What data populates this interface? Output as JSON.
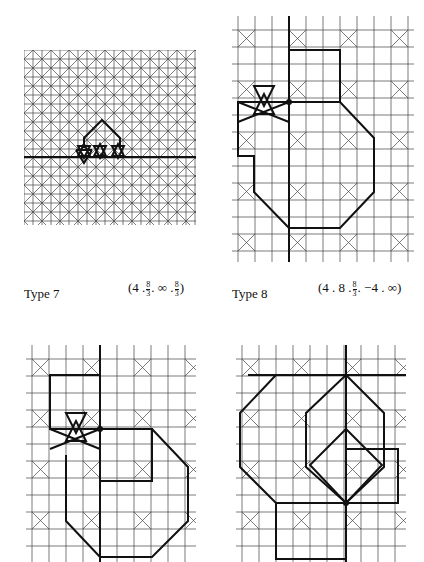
{
  "figures": [
    {
      "id": "type7",
      "label": "Type 7",
      "notation": {
        "parts": [
          "4",
          "8/3",
          "∞",
          "8/3"
        ]
      }
    },
    {
      "id": "type8",
      "label": "Type 8",
      "notation": {
        "parts": [
          "4",
          "8",
          "8/3",
          "−4",
          "∞"
        ]
      }
    },
    {
      "id": "type9_unlabeled",
      "label": ""
    },
    {
      "id": "type10_unlabeled",
      "label": ""
    }
  ],
  "captions": {
    "type7_label": "Type 7",
    "type7_open": "(4 .",
    "type7_frac_num": "8",
    "type7_frac_den": "3",
    "type7_mid": ". ∞ .",
    "type7_close": ")",
    "type8_label": "Type 8",
    "type8_open": "(4 . 8 .",
    "type8_frac_num": "8",
    "type8_frac_den": "3",
    "type8_close": ". −4 . ∞)"
  },
  "colors": {
    "ink": "#111111",
    "thin": "#444444",
    "paper": "#ffffff"
  }
}
